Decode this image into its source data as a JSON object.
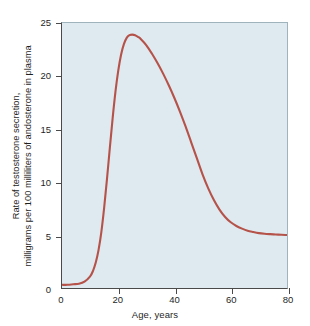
{
  "figure": {
    "background_color": "#ffffff",
    "plot_background_color": "#dfeaf0",
    "axis_color": "#4a4a4a",
    "curve_color": "#b5534a"
  },
  "chart_data": {
    "type": "line",
    "title": "",
    "xlabel": "Age, years",
    "ylabel_line1": "Rate of testosterone secretion,",
    "ylabel_line2": "milligrams per 100 milliliters of andosterone in plasma",
    "xlim": [
      0,
      80
    ],
    "ylim": [
      0,
      25
    ],
    "xticks": [
      0,
      20,
      40,
      60,
      80
    ],
    "yticks": [
      0,
      5,
      10,
      15,
      20,
      25
    ],
    "xtick_labels": [
      "0",
      "20",
      "40",
      "60",
      "80"
    ],
    "ytick_labels": [
      "0",
      "5",
      "10",
      "15",
      "20",
      "25"
    ],
    "grid": false,
    "legend": null,
    "series": [
      {
        "name": "Testosterone secretion rate",
        "color": "#b5534a",
        "x": [
          0,
          2,
          4,
          6,
          8,
          10,
          11,
          12,
          13,
          14,
          15,
          16,
          17,
          18,
          19,
          20,
          21,
          22,
          23,
          24,
          25,
          26,
          27,
          28,
          30,
          32,
          34,
          36,
          38,
          40,
          42,
          44,
          46,
          48,
          50,
          52,
          54,
          56,
          58,
          60,
          62,
          64,
          66,
          68,
          70,
          72,
          74,
          76,
          78,
          80
        ],
        "y": [
          0.3,
          0.3,
          0.35,
          0.4,
          0.6,
          1.1,
          1.6,
          2.4,
          3.6,
          5.3,
          7.6,
          10.3,
          13.2,
          16.0,
          18.5,
          20.5,
          22.0,
          23.0,
          23.6,
          23.85,
          23.9,
          23.85,
          23.7,
          23.5,
          22.9,
          22.1,
          21.2,
          20.2,
          19.1,
          17.9,
          16.6,
          15.2,
          13.7,
          12.2,
          10.7,
          9.4,
          8.3,
          7.4,
          6.7,
          6.2,
          5.85,
          5.6,
          5.4,
          5.28,
          5.18,
          5.12,
          5.08,
          5.05,
          5.02,
          5.0
        ]
      }
    ],
    "annotations": [],
    "peak": {
      "x": 25,
      "y": 23.9
    },
    "plateau_value": 5.0
  }
}
